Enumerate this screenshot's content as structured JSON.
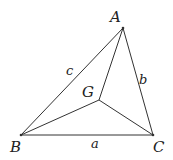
{
  "diagram": {
    "vertices": {
      "A": {
        "label": "A",
        "x": 123,
        "y": 28
      },
      "B": {
        "label": "B",
        "x": 21,
        "y": 135
      },
      "C": {
        "label": "C",
        "x": 153,
        "y": 135
      },
      "G": {
        "label": "G",
        "x": 99,
        "y": 100
      }
    },
    "sides": {
      "a": {
        "label": "a",
        "from": "B",
        "to": "C"
      },
      "b": {
        "label": "b",
        "from": "A",
        "to": "C"
      },
      "c": {
        "label": "c",
        "from": "A",
        "to": "B"
      }
    },
    "segments": [
      "AG",
      "BG",
      "CG"
    ],
    "colors": {
      "line": "#333333",
      "text": "#222222",
      "background": "#ffffff"
    }
  }
}
